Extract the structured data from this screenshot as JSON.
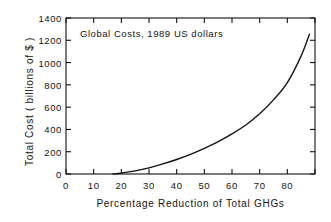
{
  "chart_data": {
    "type": "line",
    "title": "",
    "annotation": "Global Costs, 1989 US dollars",
    "xlabel": "Percentage Reduction of Total GHGs",
    "ylabel": "Total Cost ( billions of $ )",
    "xlim": [
      0,
      90
    ],
    "ylim": [
      0,
      1400
    ],
    "grid": false,
    "legend": null,
    "line_color": "#000000",
    "background_color": "#ffffff",
    "axis_color": "#000000",
    "xticks": [
      0,
      10,
      20,
      30,
      40,
      50,
      60,
      70,
      80
    ],
    "xtick_labels": [
      "0",
      "10",
      "20",
      "30",
      "40",
      "50",
      "60",
      "70",
      "80"
    ],
    "xticks_unlabeled": [
      90
    ],
    "yticks": [
      0,
      200,
      400,
      600,
      800,
      1000,
      1200,
      1400
    ],
    "ytick_labels": [
      "0",
      "200",
      "400",
      "600",
      "800",
      "1000",
      "1200",
      "1400"
    ],
    "series": [
      {
        "name": "Total cost of GHG reduction",
        "x": [
          17,
          20,
          25,
          30,
          35,
          40,
          45,
          50,
          55,
          60,
          65,
          70,
          75,
          80,
          85,
          88
        ],
        "y": [
          0,
          8,
          28,
          55,
          90,
          130,
          176,
          230,
          290,
          360,
          440,
          540,
          665,
          820,
          1060,
          1255
        ]
      }
    ]
  }
}
